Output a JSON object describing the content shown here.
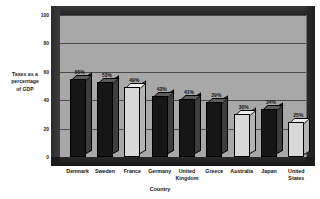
{
  "chart_data": {
    "type": "bar",
    "title": "",
    "xlabel": "Country",
    "ylabel": "Taxes as a percentage of GDP",
    "ylim": [
      0,
      100
    ],
    "yticks": [
      0,
      20,
      40,
      60,
      80,
      100
    ],
    "grid": true,
    "legend": "none",
    "style": "3d-column",
    "categories": [
      "Denmark",
      "Sweden",
      "France",
      "Germany",
      "United Kingdom",
      "Greece",
      "Australia",
      "Japan",
      "United States"
    ],
    "values": [
      55,
      53,
      49,
      43,
      41,
      39,
      30,
      34,
      25
    ],
    "data_labels": [
      "55%",
      "53%",
      "49%",
      "43%",
      "41%",
      "39%",
      "30%",
      "34%",
      "25%"
    ],
    "bar_shades": [
      "dark",
      "dark",
      "light",
      "dark",
      "dark",
      "dark",
      "light",
      "dark",
      "light"
    ]
  },
  "axes": {
    "y_title_lines": [
      "Taxes as a",
      "percentage",
      "of GDP"
    ],
    "y_tick_labels": [
      "100",
      "80",
      "60",
      "40",
      "20",
      "0"
    ],
    "x_title": "Country",
    "x_tick_lines": [
      [
        "Denmark"
      ],
      [
        "Sweden"
      ],
      [
        "France"
      ],
      [
        "Germany"
      ],
      [
        "United",
        "Kingdom"
      ],
      [
        "Greece"
      ],
      [
        "Australia"
      ],
      [
        "Japan"
      ],
      [
        "United",
        "States"
      ]
    ]
  },
  "colors": {
    "plot_background": "#a8a8a8",
    "frame": "#2e2e2e",
    "gridline": "#4a4a4a",
    "bar_dark": "#161616",
    "bar_light": "#d8d8d8",
    "text": "#111111",
    "page_background": "#ffffff"
  }
}
